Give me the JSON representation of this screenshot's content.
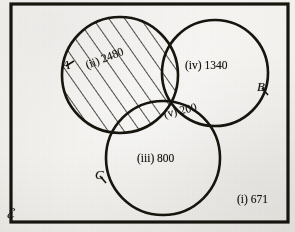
{
  "figure": {
    "type": "venn-diagram-three-set",
    "universal_set_label": "ℰ",
    "ink_color": "#16130f",
    "paper_color": "#f7f6f3",
    "border": {
      "x": 11,
      "y": 4,
      "width": 277,
      "height": 218,
      "stroke_width": 3.2
    },
    "sets": [
      {
        "key": "A",
        "label": "A",
        "cx": 120,
        "cy": 75,
        "r": 58,
        "shaded": true,
        "label_x": 62,
        "label_y": 58
      },
      {
        "key": "B",
        "label": "B",
        "cx": 215,
        "cy": 73,
        "r": 53,
        "shaded": false,
        "label_x": 257,
        "label_y": 80
      },
      {
        "key": "C",
        "label": "C",
        "cx": 163,
        "cy": 158,
        "r": 57,
        "shaded": false,
        "label_x": 95,
        "label_y": 168
      }
    ],
    "regions": [
      {
        "key": "i",
        "roman": "(i)",
        "value": "671",
        "text": "(i) 671",
        "description": "outside-all-sets",
        "x": 237,
        "y": 194,
        "rotation": 0
      },
      {
        "key": "ii",
        "roman": "(ii)",
        "value": "2480",
        "text": "(ii) 2480",
        "description": "set-A-shaded",
        "x": 86,
        "y": 60,
        "rotation": -21
      },
      {
        "key": "iii",
        "roman": "(iii)",
        "value": "800",
        "text": "(iii) 800",
        "description": "set-C-only",
        "x": 137,
        "y": 153,
        "rotation": 0
      },
      {
        "key": "iv",
        "roman": "(iv)",
        "value": "1340",
        "text": "(iv) 1340",
        "description": "set-B-only",
        "x": 185,
        "y": 60,
        "rotation": 0
      },
      {
        "key": "v",
        "roman": "(v)",
        "value": "200",
        "text": "(v) 200",
        "description": "set-B-intersect-C",
        "x": 164,
        "y": 109,
        "rotation": -13
      }
    ],
    "hatching": {
      "applies_to": "A",
      "angle_deg": 35,
      "spacing_px": 13,
      "stroke_width": 1.5
    }
  }
}
